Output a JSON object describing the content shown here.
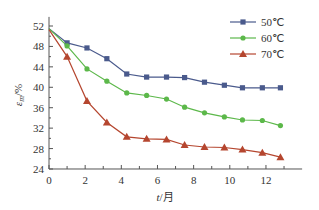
{
  "chart_data": {
    "type": "line",
    "title": "",
    "xlabel": "t/月",
    "ylabel": "ε_m/%",
    "xlim": [
      0,
      14
    ],
    "ylim": [
      24,
      53
    ],
    "xticks": [
      0,
      2,
      4,
      6,
      8,
      10,
      12
    ],
    "yticks": [
      24,
      28,
      32,
      36,
      40,
      44,
      48,
      52
    ],
    "grid": false,
    "legend_position": "top-right",
    "x": [
      0,
      1,
      2.1,
      3.2,
      4.3,
      5.4,
      6.5,
      7.5,
      8.6,
      9.7,
      10.7,
      11.8,
      12.8
    ],
    "series": [
      {
        "name": "50℃",
        "color": "#4a5a8c",
        "marker": "square",
        "values": [
          51.5,
          48.7,
          47.7,
          45.6,
          42.6,
          42.0,
          42.0,
          41.9,
          41.0,
          40.4,
          39.9,
          39.9,
          39.9
        ]
      },
      {
        "name": "60℃",
        "color": "#5cb84a",
        "marker": "circle",
        "values": [
          51.5,
          48.1,
          43.6,
          41.2,
          38.9,
          38.4,
          37.7,
          36.1,
          35.0,
          34.2,
          33.6,
          33.5,
          32.5
        ]
      },
      {
        "name": "70℃",
        "color": "#b5462f",
        "marker": "triangle",
        "values": [
          51.3,
          46.0,
          37.3,
          33.1,
          30.3,
          29.9,
          29.8,
          28.7,
          28.3,
          28.2,
          27.8,
          27.2,
          26.3
        ]
      }
    ]
  },
  "axes": {
    "x_title_t": "t",
    "x_title_unit": "/月",
    "y_title_eps": "ε",
    "y_title_sub": "m",
    "y_title_unit": "/%"
  },
  "legend": {
    "items": [
      {
        "label": "50℃"
      },
      {
        "label": "60℃"
      },
      {
        "label": "70℃"
      }
    ]
  }
}
